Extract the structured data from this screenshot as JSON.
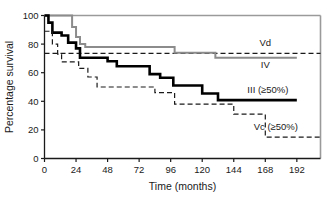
{
  "chart_data": {
    "type": "line",
    "title": "",
    "xlabel": "Time (months)",
    "ylabel": "Percentage survival",
    "xlim": [
      0,
      210
    ],
    "ylim": [
      0,
      100
    ],
    "grid": false,
    "legend_position": "inline-right",
    "xticks": [
      0,
      24,
      48,
      72,
      96,
      120,
      144,
      168,
      192
    ],
    "yticks": [
      0,
      20,
      40,
      60,
      80,
      100
    ],
    "series": [
      {
        "name": "Vd",
        "style": "dashed",
        "color": "#1a1a1a",
        "label": "Vd",
        "points": [
          [
            0,
            73.5
          ],
          [
            210,
            73.5
          ]
        ]
      },
      {
        "name": "IV",
        "style": "solid",
        "color": "#8c8c8c",
        "label": "IV",
        "points": [
          [
            0,
            100
          ],
          [
            21,
            100
          ],
          [
            21,
            92
          ],
          [
            24,
            92
          ],
          [
            24,
            85
          ],
          [
            27,
            85
          ],
          [
            27,
            80
          ],
          [
            31,
            80
          ],
          [
            31,
            78
          ],
          [
            99,
            78
          ],
          [
            99,
            74
          ],
          [
            130,
            74
          ],
          [
            130,
            70.5
          ],
          [
            192,
            70.5
          ]
        ]
      },
      {
        "name": "III (>=50%)",
        "style": "solid-bold",
        "color": "#000000",
        "label": "III (≥50%)",
        "points": [
          [
            0,
            100
          ],
          [
            3,
            100
          ],
          [
            3,
            95
          ],
          [
            6,
            95
          ],
          [
            6,
            88
          ],
          [
            13,
            88
          ],
          [
            13,
            86
          ],
          [
            18,
            86
          ],
          [
            18,
            81
          ],
          [
            24,
            81
          ],
          [
            24,
            77
          ],
          [
            27,
            77
          ],
          [
            27,
            70.5
          ],
          [
            48,
            70.5
          ],
          [
            48,
            68
          ],
          [
            55,
            68
          ],
          [
            55,
            64.5
          ],
          [
            80,
            64.5
          ],
          [
            80,
            59
          ],
          [
            88,
            59
          ],
          [
            88,
            56.5
          ],
          [
            98,
            56.5
          ],
          [
            98,
            51
          ],
          [
            120,
            51
          ],
          [
            120,
            45.5
          ],
          [
            132,
            45.5
          ],
          [
            132,
            40.8
          ],
          [
            192,
            40.8
          ]
        ]
      },
      {
        "name": "Vc (>=50%)",
        "style": "dashed",
        "color": "#1a1a1a",
        "label": "Vc (≥50%)",
        "points": [
          [
            0,
            89
          ],
          [
            6,
            89
          ],
          [
            6,
            80
          ],
          [
            10,
            80
          ],
          [
            10,
            73
          ],
          [
            13,
            73
          ],
          [
            13,
            67.5
          ],
          [
            26,
            67.5
          ],
          [
            26,
            63
          ],
          [
            33,
            63
          ],
          [
            33,
            57
          ],
          [
            40,
            57
          ],
          [
            40,
            50
          ],
          [
            84,
            50
          ],
          [
            84,
            46
          ],
          [
            99,
            46
          ],
          [
            99,
            38
          ],
          [
            144,
            38
          ],
          [
            144,
            31
          ],
          [
            168,
            31
          ],
          [
            168,
            15
          ],
          [
            210,
            15
          ]
        ]
      }
    ],
    "annotations": [
      {
        "text": "Vd",
        "x": 168,
        "y": 79
      },
      {
        "text": "IV",
        "x": 168,
        "y": 63
      },
      {
        "text": "III (≥50%)",
        "x": 170,
        "y": 46
      },
      {
        "text": "Vc (≥50%)",
        "x": 176,
        "y": 20
      }
    ]
  }
}
